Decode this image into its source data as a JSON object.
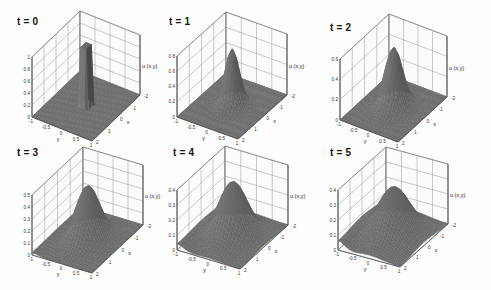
{
  "figure": {
    "background": "#fdfdfd",
    "surface_color": "#4a4a4a",
    "grid_color": "#8a8a8a"
  },
  "panels": [
    {
      "title": "t = 0",
      "zlabel": "u (x,y)",
      "xlabel": "x",
      "ylabel": "y",
      "zticks": [
        "0",
        "0.2",
        "0.4",
        "0.6",
        "0.8",
        "1"
      ],
      "zmax": 1.0
    },
    {
      "title": "t = 1",
      "zlabel": "u (x,y)",
      "xlabel": "x",
      "ylabel": "y",
      "zticks": [
        "0",
        "0.2",
        "0.4",
        "0.6",
        "0.8"
      ],
      "zmax": 0.8
    },
    {
      "title": "t = 2",
      "zlabel": "u (x,y)",
      "xlabel": "x",
      "ylabel": "y",
      "zticks": [
        "0",
        "0.2",
        "0.4",
        "0.6"
      ],
      "zmax": 0.6
    },
    {
      "title": "t = 3",
      "zlabel": "u (x,y)",
      "xlabel": "x",
      "ylabel": "y",
      "zticks": [
        "0",
        "0.1",
        "0.2",
        "0.3",
        "0.4",
        "0.5"
      ],
      "zmax": 0.5
    },
    {
      "title": "t = 4",
      "zlabel": "u (x,y)",
      "xlabel": "x",
      "ylabel": "y",
      "zticks": [
        "0",
        "0.1",
        "0.2",
        "0.3",
        "0.4"
      ],
      "zmax": 0.4
    },
    {
      "title": "t = 5",
      "zlabel": "u (x,y)",
      "xlabel": "x",
      "ylabel": "y",
      "zticks": [
        "0",
        "0.1",
        "0.2",
        "0.3",
        "0.4"
      ],
      "zmax": 0.4
    }
  ],
  "chart_data": [
    {
      "type": "surface",
      "title": "t = 0",
      "xlabel": "x",
      "ylabel": "y",
      "zlabel": "u (x,y)",
      "xlim": [
        -2,
        2
      ],
      "ylim": [
        -1,
        1
      ],
      "zlim": [
        0,
        1
      ],
      "xticks": [
        "-2",
        "-1",
        "0",
        "1",
        "2"
      ],
      "yticks": [
        "-1",
        "-0.5",
        "0",
        "0.5",
        "1"
      ],
      "zticks": [
        "0",
        "0.2",
        "0.4",
        "0.6",
        "0.8",
        "1"
      ],
      "description": "Cylindrical step: u = 1 inside a small disk at origin, 0 elsewhere",
      "peak": 1.0
    },
    {
      "type": "surface",
      "title": "t = 1",
      "xlabel": "x",
      "ylabel": "y",
      "zlabel": "u (x,y)",
      "xlim": [
        -2,
        2
      ],
      "ylim": [
        -1,
        1
      ],
      "zlim": [
        0,
        0.8
      ],
      "xticks": [
        "-2",
        "-1",
        "0",
        "1",
        "2"
      ],
      "yticks": [
        "-1",
        "-0.5",
        "0",
        "0.5",
        "1"
      ],
      "zticks": [
        "0",
        "0.2",
        "0.4",
        "0.6",
        "0.8"
      ],
      "description": "Narrow Gaussian-like peak at origin",
      "peak": 0.75
    },
    {
      "type": "surface",
      "title": "t = 2",
      "xlabel": "x",
      "ylabel": "y",
      "zlabel": "u (x,y)",
      "xlim": [
        -2,
        2
      ],
      "ylim": [
        -1,
        1
      ],
      "zlim": [
        0,
        0.6
      ],
      "xticks": [
        "-2",
        "-1",
        "0",
        "1",
        "2"
      ],
      "yticks": [
        "-1",
        "-0.5",
        "0",
        "0.5",
        "1"
      ],
      "zticks": [
        "0",
        "0.2",
        "0.4",
        "0.6"
      ],
      "description": "Wider Gaussian-like peak",
      "peak": 0.6
    },
    {
      "type": "surface",
      "title": "t = 3",
      "xlabel": "x",
      "ylabel": "y",
      "zlabel": "u (x,y)",
      "xlim": [
        -2,
        2
      ],
      "ylim": [
        -1,
        1
      ],
      "zlim": [
        0,
        0.5
      ],
      "xticks": [
        "-2",
        "-1",
        "0",
        "1",
        "2"
      ],
      "yticks": [
        "-1",
        "-0.5",
        "0",
        "0.5",
        "1"
      ],
      "zticks": [
        "0",
        "0.1",
        "0.2",
        "0.3",
        "0.4",
        "0.5"
      ],
      "description": "Broad peak, spreading to boundaries",
      "peak": 0.45
    },
    {
      "type": "surface",
      "title": "t = 4",
      "xlabel": "x",
      "ylabel": "y",
      "zlabel": "u (x,y)",
      "xlim": [
        -2,
        2
      ],
      "ylim": [
        -1,
        1
      ],
      "zlim": [
        0,
        0.4
      ],
      "xticks": [
        "-2",
        "-1",
        "0",
        "1",
        "2"
      ],
      "yticks": [
        "-1",
        "-0.5",
        "0",
        "0.5",
        "1"
      ],
      "zticks": [
        "0",
        "0.1",
        "0.2",
        "0.3",
        "0.4"
      ],
      "description": "Broad peak, elevated edges",
      "peak": 0.37
    },
    {
      "type": "surface",
      "title": "t = 5",
      "xlabel": "x",
      "ylabel": "y",
      "zlabel": "u (x,y)",
      "xlim": [
        -2,
        2
      ],
      "ylim": [
        -1,
        1
      ],
      "zlim": [
        0,
        0.4
      ],
      "xticks": [
        "-2",
        "-1",
        "0",
        "1",
        "2"
      ],
      "yticks": [
        "-1",
        "-0.5",
        "0",
        "0.5",
        "1"
      ],
      "zticks": [
        "0",
        "0.1",
        "0.2",
        "0.3",
        "0.4"
      ],
      "description": "Broadest, flattest peak",
      "peak": 0.33
    }
  ]
}
